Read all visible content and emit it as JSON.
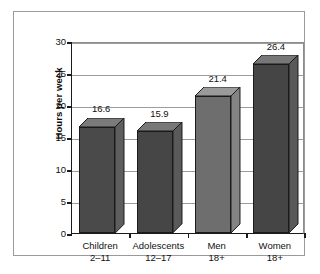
{
  "chart_data": {
    "type": "bar",
    "title": "",
    "subtitle": "",
    "xlabel": "",
    "ylabel": "Hours per week",
    "categories": [
      "Children 2–11",
      "Adolescents 12–17",
      "Men 18+",
      "Women 18+"
    ],
    "category_lines": [
      {
        "line1": "Children",
        "line2": "2–11"
      },
      {
        "line1": "Adolescents",
        "line2": "12–17"
      },
      {
        "line1": "Men",
        "line2": "18+"
      },
      {
        "line1": "Women",
        "line2": "18+"
      }
    ],
    "values": [
      16.6,
      15.9,
      21.4,
      26.4
    ],
    "value_labels": [
      "16.6",
      "15.9",
      "21.4",
      "26.4"
    ],
    "ylim": [
      0,
      30
    ],
    "yticks": [
      0,
      5,
      10,
      15,
      20,
      25,
      30
    ],
    "ytick_labels": [
      "0",
      "5",
      "10",
      "15",
      "20",
      "25",
      "30"
    ],
    "grid": true,
    "legend": "none",
    "style": "3d-column",
    "bar_colors": [
      "#4a4a4a",
      "#464646",
      "#6e6e6e",
      "#454545"
    ],
    "bar_top_colors": [
      "#7b7b7b",
      "#787878",
      "#9a9a9a",
      "#777777"
    ],
    "bar_side_colors": [
      "#5e5e5e",
      "#5a5a5a",
      "#848484",
      "#595959"
    ]
  },
  "figure": {
    "frame_color": "#9a9a9a",
    "axis_color": "#1a1a1a",
    "grid_color": "#9c9c9c",
    "background": "#ffffff",
    "text_color": "#111111"
  }
}
